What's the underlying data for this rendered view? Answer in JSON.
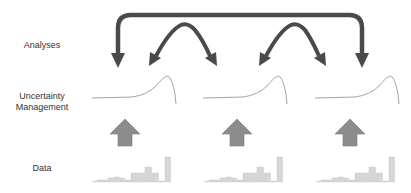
{
  "labels": {
    "analyses": "Analyses",
    "uncertainty_line1": "Uncertainty",
    "uncertainty_line2": "Management",
    "data": "Data"
  },
  "colors": {
    "feedback_arrow": "#4a4a4a",
    "up_arrow_fill": "#8c8c8c",
    "up_arrow_stroke": "#7a7a7a",
    "curve": "#aaaaaa",
    "bar_fill": "#d6d6d6",
    "bar_stroke": "#c4c4c4",
    "text": "#333333"
  },
  "panels": [
    {
      "id": "panel-1",
      "x": 92
    },
    {
      "id": "panel-2",
      "x": 203
    },
    {
      "id": "panel-3",
      "x": 315
    }
  ],
  "histogram": {
    "bar_heights": [
      1,
      2,
      2,
      4,
      5,
      4,
      2,
      9,
      9,
      15,
      9,
      1,
      25
    ]
  },
  "feedback_arrows": [
    {
      "type": "bracket",
      "from": "panel-3",
      "to": "panel-1",
      "description": "long feedback from last analysis to first"
    },
    {
      "type": "arc",
      "between": [
        "panel-1",
        "panel-2"
      ]
    },
    {
      "type": "arc",
      "between": [
        "panel-2",
        "panel-3"
      ]
    }
  ]
}
